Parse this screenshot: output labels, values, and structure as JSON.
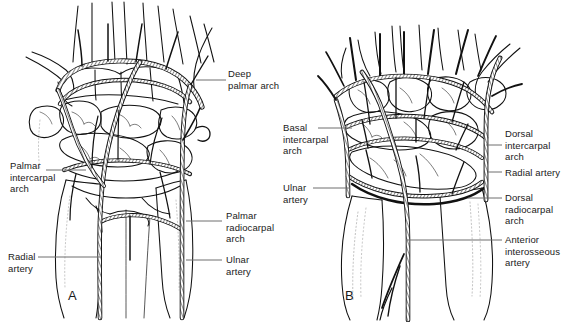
{
  "figure": {
    "background_color": "#ffffff",
    "ink_color": "#111111",
    "leader_color": "#6f6f6f",
    "panels": [
      {
        "id": "A",
        "letter": "A",
        "view": "palmar",
        "labels": [
          {
            "key": "deep_palmar_arch",
            "text": "Deep\npalmar arch"
          },
          {
            "key": "palmar_intercarpal_arch",
            "text": "Palmar\nintercarpal\narch"
          },
          {
            "key": "palmar_radiocarpal_arch",
            "text": "Palmar\nradiocarpal\narch"
          },
          {
            "key": "radial_artery",
            "text": "Radial\nartery"
          },
          {
            "key": "ulnar_artery",
            "text": "Ulnar\nartery"
          }
        ]
      },
      {
        "id": "B",
        "letter": "B",
        "view": "dorsal",
        "labels": [
          {
            "key": "basal_intercarpal_arch",
            "text": "Basal\nintercarpal\narch"
          },
          {
            "key": "ulnar_artery_b",
            "text": "Ulnar\nartery"
          },
          {
            "key": "dorsal_intercarpal_arch",
            "text": "Dorsal\nintercarpal\narch"
          },
          {
            "key": "radial_artery_b",
            "text": "Radial artery"
          },
          {
            "key": "dorsal_radiocarpal_arch",
            "text": "Dorsal\nradiocarpal\narch"
          },
          {
            "key": "anterior_interosseous_artery",
            "text": "Anterior\ninterosseous\nartery"
          }
        ]
      }
    ]
  },
  "panelA": {
    "letter": "A",
    "deep_palmar_arch": "Deep\npalmar arch",
    "palmar_intercarpal_arch": "Palmar\nintercarpal\narch",
    "palmar_radiocarpal_arch": "Palmar\nradiocarpal\narch",
    "radial_artery": "Radial\nartery",
    "ulnar_artery": "Ulnar\nartery"
  },
  "panelB": {
    "letter": "B",
    "basal_intercarpal_arch": "Basal\nintercarpal\narch",
    "ulnar_artery": "Ulnar\nartery",
    "dorsal_intercarpal_arch": "Dorsal\nintercarpal\narch",
    "radial_artery": "Radial artery",
    "dorsal_radiocarpal_arch": "Dorsal\nradiocarpal\narch",
    "anterior_interosseous_artery": "Anterior\ninterosseous\nartery"
  }
}
